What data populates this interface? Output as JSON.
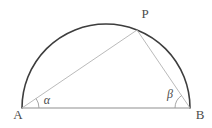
{
  "figure": {
    "type": "geometry-diagram",
    "background": "#ffffff",
    "labels": {
      "P": "P",
      "A": "A",
      "B": "B",
      "alpha": "α",
      "beta": "β"
    },
    "geometry": {
      "center": {
        "x": 106,
        "y": 108
      },
      "radius": 84,
      "points": {
        "A": {
          "x": 22,
          "y": 108
        },
        "B": {
          "x": 190,
          "y": 108
        },
        "P": {
          "x": 137,
          "y": 30
        }
      },
      "angle_arc_radius_at_A": 17,
      "angle_arc_radius_at_B": 15
    },
    "colors": {
      "arc": "#3d3d3d",
      "diameter": "#8f8f8f",
      "chords": "#b2b2b2",
      "angle_arcs": "#9c9c9c",
      "labels": "#4b4b4b"
    }
  }
}
